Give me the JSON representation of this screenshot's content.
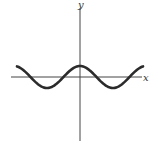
{
  "chart_data": {
    "type": "line",
    "title": "",
    "xlabel": "x",
    "ylabel": "y",
    "function": "cos",
    "series": [
      {
        "name": "y = cos(x)",
        "x": [
          -6.0,
          -5.0,
          -4.0,
          -3.14,
          -2.0,
          -1.0,
          0.0,
          1.0,
          2.0,
          3.14,
          4.0,
          5.0,
          6.0
        ],
        "values": [
          0.96,
          0.28,
          -0.65,
          -1.0,
          -0.42,
          0.54,
          1.0,
          0.54,
          -0.42,
          -1.0,
          -0.65,
          0.28,
          0.96
        ]
      }
    ],
    "xlim": [
      -6.2,
      6.2
    ],
    "ylim": [
      -6.5,
      6.5
    ],
    "grid": false,
    "ticks": false,
    "legend": null
  },
  "labels": {
    "x_axis": "x",
    "y_axis": "y"
  },
  "colors": {
    "curve": "#2b2b2b",
    "axes": "#444444",
    "background": "#ffffff"
  }
}
